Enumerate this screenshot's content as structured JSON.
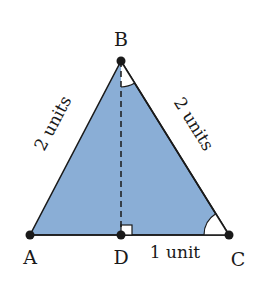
{
  "diagram": {
    "type": "triangle",
    "fill_color": "#8aaed6",
    "stroke_color": "#1a1a1a",
    "vertices": {
      "A": {
        "label": "A",
        "x": 30,
        "y": 235
      },
      "B": {
        "label": "B",
        "x": 121,
        "y": 61
      },
      "C": {
        "label": "C",
        "x": 229,
        "y": 235
      },
      "D": {
        "label": "D",
        "x": 121,
        "y": 235
      }
    },
    "edge_labels": {
      "AB": "2 units",
      "BC": "2 units",
      "DC": "1 unit"
    },
    "altitude": {
      "from": "B",
      "to": "D",
      "style": "dashed"
    },
    "marks": {
      "right_angle_at": "D",
      "angle_arc_at": [
        "B",
        "C"
      ]
    }
  }
}
